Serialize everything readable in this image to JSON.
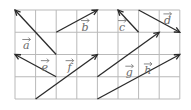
{
  "diagram": {
    "grid": {
      "columns": 8,
      "rows": 4
    },
    "colors": {
      "grid": "#b9b9b9",
      "vector": "#2a2a2a",
      "label": "#6a6a6a"
    },
    "vectors": [
      {
        "name": "a",
        "from": [
          2,
          2
        ],
        "to": [
          0,
          0
        ],
        "label_cell": [
          0.55,
          1.55
        ]
      },
      {
        "name": "b",
        "from": [
          2,
          1
        ],
        "to": [
          4,
          0
        ],
        "label_cell": [
          3.4,
          0.7
        ]
      },
      {
        "name": "c",
        "from": [
          6,
          1
        ],
        "to": [
          5,
          0
        ],
        "label_cell": [
          5.2,
          0.7
        ]
      },
      {
        "name": "d",
        "from": [
          6,
          0
        ],
        "to": [
          8,
          1
        ],
        "label_cell": [
          7.4,
          0.4
        ]
      },
      {
        "name": "e",
        "from": [
          2,
          3
        ],
        "to": [
          0,
          2
        ],
        "label_cell": [
          1.45,
          2.5
        ]
      },
      {
        "name": "f",
        "from": [
          1,
          4
        ],
        "to": [
          4,
          2
        ],
        "label_cell": [
          2.65,
          2.5
        ]
      },
      {
        "name": "g",
        "from": [
          4,
          3
        ],
        "to": [
          7,
          1
        ],
        "label_cell": [
          5.55,
          2.75
        ]
      },
      {
        "name": "h",
        "from": [
          4,
          4
        ],
        "to": [
          8,
          2
        ],
        "label_cell": [
          6.45,
          2.65
        ]
      }
    ]
  }
}
